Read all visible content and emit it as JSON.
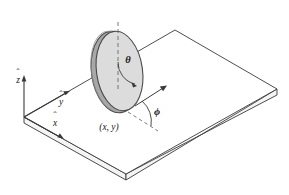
{
  "figure": {
    "background_color": "#ffffff",
    "line_color": "#3a3a3a",
    "text_color": "#1a1a1a"
  },
  "axes": {
    "z": {
      "label": "z",
      "hat": "ˆ"
    },
    "y": {
      "label": "y",
      "hat": "ˆ"
    },
    "x": {
      "label": "x",
      "hat": "ˆ"
    }
  },
  "angles": {
    "theta": {
      "symbol": "θ"
    },
    "phi": {
      "symbol": "ϕ"
    }
  },
  "position": {
    "label": "(x, y)"
  },
  "disk": {
    "face_color": "#dcdcdc",
    "rim_color": "#9a9a9a",
    "edge_color": "#4a4a4a"
  },
  "plane": {
    "top_color": "#ffffff",
    "side_color": "#f2f2f2",
    "edge_color": "#3a3a3a"
  }
}
